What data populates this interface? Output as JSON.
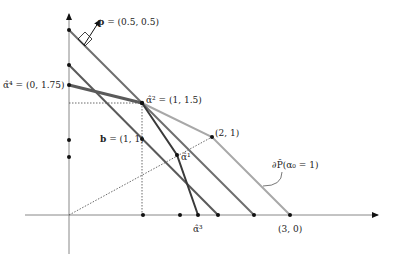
{
  "diagram": {
    "type": "geometry-plot",
    "labels": {
      "p": "p",
      "p_value": " = (0.5, 0.5)",
      "alpha4": "α̂⁴ = (0, 1.75)",
      "alpha2": "α̂² = (1, 1.5)",
      "b": "b",
      "b_value": " = (1, 1)",
      "point21": "(2, 1)",
      "alpha1": "α̂¹",
      "alpha3": "α̂³",
      "point30": "(3, 0)",
      "boundary": "∂P̂(α₀ = 1)"
    },
    "points": {
      "alpha4": [
        0,
        1.75
      ],
      "alpha2": [
        1,
        1.5
      ],
      "b": [
        1,
        1
      ],
      "point21": [
        2,
        1
      ],
      "point30": [
        3,
        0
      ],
      "p": [
        0.5,
        0.5
      ]
    },
    "colors": {
      "axis": "#888888",
      "light_line": "#a8a8a8",
      "mid_line": "#6e6e6e",
      "dark_line": "#4a4a4a",
      "dot": "#111111"
    }
  }
}
